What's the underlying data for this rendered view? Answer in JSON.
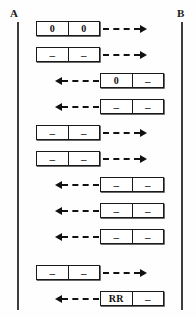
{
  "diagram": {
    "type": "sequence-diagram",
    "endpoints": [
      {
        "id": "a",
        "label": "A"
      },
      {
        "id": "b",
        "label": "B"
      }
    ],
    "colors": {
      "line": "#1a1a1a",
      "lifeline": "#3d3d3d",
      "background": "#fefefe",
      "text": "#111111"
    },
    "arrow_style": "dashed-with-solid-head",
    "rows": [
      {
        "index": 1,
        "top": 18,
        "direction": "right",
        "box_position": "left",
        "cells": [
          "0",
          "0"
        ],
        "arrow_icon": "arrow-right-dashed-icon"
      },
      {
        "index": 2,
        "top": 44,
        "direction": "right",
        "box_position": "left",
        "cells": [
          "–",
          "–"
        ],
        "arrow_icon": "arrow-right-dashed-icon"
      },
      {
        "index": 3,
        "top": 70,
        "direction": "left",
        "box_position": "right",
        "cells": [
          "0",
          "–"
        ],
        "arrow_icon": "arrow-left-dashed-icon"
      },
      {
        "index": 4,
        "top": 96,
        "direction": "left",
        "box_position": "right",
        "cells": [
          "–",
          "–"
        ],
        "arrow_icon": "arrow-left-dashed-icon"
      },
      {
        "index": 5,
        "top": 122,
        "direction": "right",
        "box_position": "left",
        "cells": [
          "–",
          "–"
        ],
        "arrow_icon": "arrow-right-dashed-icon"
      },
      {
        "index": 6,
        "top": 148,
        "direction": "right",
        "box_position": "left",
        "cells": [
          "–",
          "–"
        ],
        "arrow_icon": "arrow-right-dashed-icon"
      },
      {
        "index": 7,
        "top": 174,
        "direction": "left",
        "box_position": "right",
        "cells": [
          "–",
          "–"
        ],
        "arrow_icon": "arrow-left-dashed-icon"
      },
      {
        "index": 8,
        "top": 200,
        "direction": "left",
        "box_position": "right",
        "cells": [
          "–",
          "–"
        ],
        "arrow_icon": "arrow-left-dashed-icon"
      },
      {
        "index": 9,
        "top": 226,
        "direction": "left",
        "box_position": "right",
        "cells": [
          "–",
          "–"
        ],
        "arrow_icon": "arrow-left-dashed-icon"
      },
      {
        "index": 10,
        "top": 262,
        "direction": "right",
        "box_position": "left",
        "cells": [
          "–",
          "–"
        ],
        "arrow_icon": "arrow-right-dashed-icon"
      },
      {
        "index": 11,
        "top": 288,
        "direction": "left",
        "box_position": "right",
        "cells": [
          "RR",
          "–"
        ],
        "arrow_icon": "arrow-left-dashed-icon"
      }
    ]
  }
}
